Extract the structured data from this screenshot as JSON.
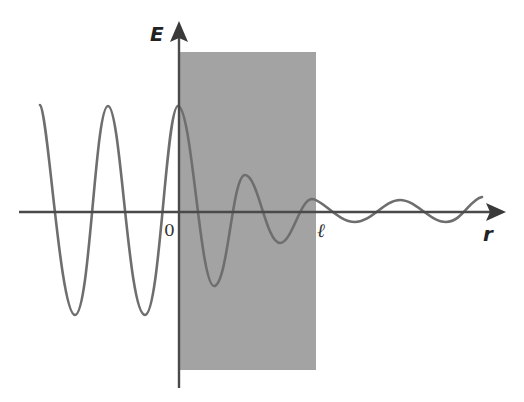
{
  "diagram": {
    "title": "",
    "axes": {
      "vertical_label": "E",
      "horizontal_label": "r",
      "origin_label": "0",
      "boundary_label": "ℓ"
    },
    "region": {
      "description": "shaded slab from r = 0 to r = ℓ",
      "fill_color": "#a3a3a3"
    },
    "wave": {
      "description": "oscillating field: constant amplitude for r < 0, exponentially decaying inside slab 0 < r < ℓ, small constant amplitude for r > ℓ",
      "stroke_color": "#6e6e6e"
    },
    "axis_color": "#4a4a4a"
  }
}
